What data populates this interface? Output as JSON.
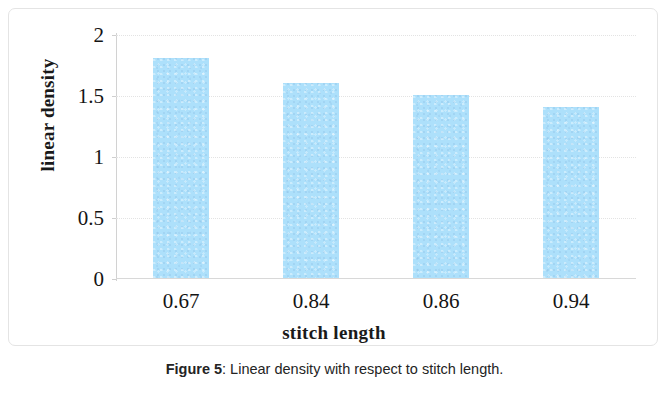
{
  "figure": {
    "caption_label": "Figure 5",
    "caption_separator": ":",
    "caption_text": "Linear density with respect to stitch length."
  },
  "chart_data": {
    "type": "bar",
    "title": "",
    "xlabel": "stitch length",
    "ylabel": "linear density",
    "categories": [
      "0.67",
      "0.84",
      "0.86",
      "0.94"
    ],
    "values": [
      1.8,
      1.6,
      1.5,
      1.4
    ],
    "ylim": [
      0,
      2
    ],
    "ytick_labels": [
      "0",
      "0.5",
      "1",
      "1.5",
      "2"
    ],
    "ytick_values": [
      0,
      0.5,
      1,
      1.5,
      2
    ],
    "grid": "horizontal-dotted",
    "legend": "none",
    "bar_color": "#ade0fb",
    "gridline_color": "#e3e3e3",
    "axis_color": "#d2d2d2",
    "text_color": "#141414"
  }
}
